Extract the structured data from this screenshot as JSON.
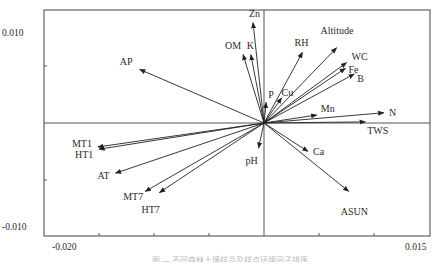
{
  "chart_data": {
    "type": "scatter",
    "subtype": "biplot-arrows",
    "title": "",
    "xlabel": "",
    "ylabel": "",
    "xlim": [
      -0.02,
      0.015
    ],
    "ylim": [
      -0.011,
      0.0115
    ],
    "x_tick_labels": [
      {
        "value": -0.02,
        "text": "-0.020"
      },
      {
        "value": 0.015,
        "text": "0.015"
      }
    ],
    "y_tick_labels": [
      {
        "value": 0.01,
        "text": "0.010"
      },
      {
        "value": -0.01,
        "text": "-0.010"
      }
    ],
    "x_ticks": [
      -0.015,
      -0.01,
      -0.005,
      0.005,
      0.01
    ],
    "y_ticks": [
      0.005,
      -0.005
    ],
    "grid": false,
    "reference_lines": {
      "x": 0,
      "y": 0
    },
    "arrows": [
      {
        "name": "Zn",
        "x": -0.001,
        "y": 0.0088,
        "lx": -4,
        "ly": -6
      },
      {
        "name": "OM",
        "x": -0.0019,
        "y": 0.006,
        "lx": -18,
        "ly": -6
      },
      {
        "name": "K",
        "x": -0.0012,
        "y": 0.006,
        "lx": -4,
        "ly": -6
      },
      {
        "name": "P",
        "x": 0.0002,
        "y": 0.0018,
        "lx": 2,
        "ly": -4
      },
      {
        "name": "Cu",
        "x": 0.0016,
        "y": 0.0022,
        "lx": 0,
        "ly": -2
      },
      {
        "name": "RH",
        "x": 0.0035,
        "y": 0.0062,
        "lx": -8,
        "ly": -6
      },
      {
        "name": "Altitude",
        "x": 0.0066,
        "y": 0.0066,
        "lx": -16,
        "ly": -14
      },
      {
        "name": "WC",
        "x": 0.0075,
        "y": 0.0053,
        "lx": 5,
        "ly": -3
      },
      {
        "name": "Fe",
        "x": 0.0074,
        "y": 0.0048,
        "lx": 3,
        "ly": 5
      },
      {
        "name": "B",
        "x": 0.0082,
        "y": 0.0043,
        "lx": 3,
        "ly": 8
      },
      {
        "name": "Mn",
        "x": 0.0048,
        "y": 0.0007,
        "lx": 4,
        "ly": -3
      },
      {
        "name": "N",
        "x": 0.0109,
        "y": 0.0009,
        "lx": 5,
        "ly": 3
      },
      {
        "name": "TWS",
        "x": 0.0092,
        "y": 0.0001,
        "lx": 2,
        "ly": 12
      },
      {
        "name": "AP",
        "x": -0.0113,
        "y": 0.0047,
        "lx": -20,
        "ly": -4
      },
      {
        "name": "MT1",
        "x": -0.0151,
        "y": -0.0021,
        "lx": -26,
        "ly": 0
      },
      {
        "name": "HT1",
        "x": -0.015,
        "y": -0.0023,
        "lx": -24,
        "ly": 9
      },
      {
        "name": "AT",
        "x": -0.0135,
        "y": -0.0044,
        "lx": -18,
        "ly": 6
      },
      {
        "name": "MT7",
        "x": -0.0108,
        "y": -0.006,
        "lx": -22,
        "ly": 9
      },
      {
        "name": "HT7",
        "x": -0.0095,
        "y": -0.0061,
        "lx": -18,
        "ly": 20
      },
      {
        "name": "pH",
        "x": -0.0005,
        "y": -0.0022,
        "lx": -13,
        "ly": 16
      },
      {
        "name": "Ca",
        "x": 0.004,
        "y": -0.0025,
        "lx": 5,
        "ly": 3
      },
      {
        "name": "ASUN",
        "x": 0.0077,
        "y": -0.006,
        "lx": -8,
        "ly": 24
      }
    ]
  },
  "layout": {
    "frame": {
      "left": 44,
      "top": 10,
      "right": 430,
      "bottom": 236
    },
    "origin_px": {
      "x": 264,
      "y": 123
    },
    "px_per_unit_x": 11000,
    "px_per_unit_y": 11400,
    "tick_label_pos": {
      "y_top": {
        "x": 2,
        "y": 36
      },
      "y_bottom": {
        "x": 2,
        "y": 230
      },
      "x_left": {
        "x": 52,
        "y": 250
      },
      "x_right": {
        "x": 405,
        "y": 250
      }
    },
    "tick_px": {
      "x": [
        99,
        154,
        209,
        319,
        374
      ],
      "y": [
        66,
        180
      ]
    }
  },
  "caption": "图 — 不同森林土壤样品及样点环境因子排序"
}
